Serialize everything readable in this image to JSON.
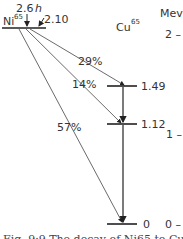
{
  "diagram": {
    "type": "nuclear-decay-scheme",
    "parent": {
      "symbol": "Ni",
      "mass": "65",
      "level_mev": "2.10",
      "half_life": "2.6 h"
    },
    "daughter": {
      "symbol": "Cu",
      "mass": "65"
    },
    "daughter_levels": [
      "1.49",
      "1.12",
      "0"
    ],
    "branches": [
      {
        "label": "29%",
        "to": "1.49"
      },
      {
        "label": "14%",
        "to": "1.12"
      },
      {
        "label": "57%",
        "to": "0"
      }
    ],
    "scale": {
      "unit": "Mev",
      "ticks": [
        "2 –",
        "1 –",
        "0 –"
      ]
    },
    "caption": "Fig. 9-9 The decay of Ni65 to Cu65"
  },
  "text": {
    "ni": "Ni",
    "ni_mass": "65",
    "cu": "Cu",
    "cu_mass": "65",
    "half_life": "2.6",
    "half_life_unit": "h",
    "parent_energy": "2.10",
    "level_149": "1.49",
    "level_112": "1.12",
    "level_0": "0",
    "b29": "29%",
    "b14": "14%",
    "b57": "57%",
    "mev": "Mev",
    "t2": "2 –",
    "t1": "1 –",
    "t0": "0 –",
    "caption": "Fig. 9·9 The decay of Ni65 to Cu65"
  }
}
